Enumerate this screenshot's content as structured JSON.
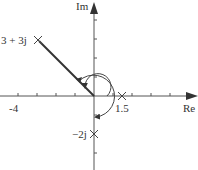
{
  "diagram": {
    "type": "complex-plane",
    "axes": {
      "x_label": "Re",
      "y_label": "Im",
      "x_tick_label": "-4",
      "unit_px": 19,
      "origin_px": [
        94,
        96
      ]
    },
    "points": [
      {
        "label": "3 + 3j",
        "re": -3,
        "im": 3,
        "marker": "x"
      },
      {
        "label": "1.5",
        "re": 1.5,
        "im": 0,
        "marker": "x"
      },
      {
        "label": "−2j",
        "re": 0,
        "im": -2,
        "marker": "x"
      }
    ],
    "vector": {
      "from": [
        0,
        0
      ],
      "to": [
        -3,
        3
      ]
    },
    "arcs": [
      {
        "description": "inner angle arc from positive real axis counter-clockwise to vector",
        "radius_units": 0.7
      },
      {
        "description": "outer angle arc clockwise from vector around to negative direction",
        "radius_units": 1.3
      }
    ],
    "colors": {
      "line": "#333333",
      "background": "#ffffff"
    }
  }
}
